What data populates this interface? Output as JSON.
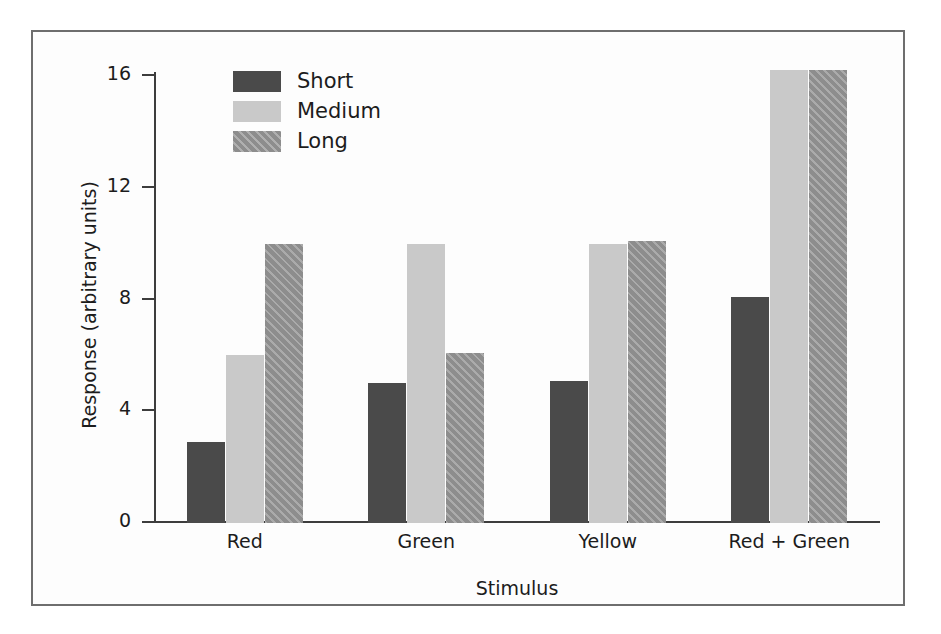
{
  "chart_data": {
    "type": "bar",
    "title": "",
    "subtitle": "",
    "xlabel": "Stimulus",
    "ylabel": "Response (arbitrary units)",
    "categories": [
      "Red",
      "Green",
      "Yellow",
      "Red + Green"
    ],
    "series": [
      {
        "name": "Short",
        "values": [
          2.9,
          5.0,
          5.1,
          8.1
        ],
        "color": "#4a4a4a",
        "pattern": "solid"
      },
      {
        "name": "Medium",
        "values": [
          6.0,
          10.0,
          10.0,
          16.2
        ],
        "color": "#c9c9c9",
        "pattern": "solid"
      },
      {
        "name": "Long",
        "values": [
          10.0,
          6.1,
          10.1,
          16.2
        ],
        "color": "#8d8d8d",
        "pattern": "diagonal-hatch"
      }
    ],
    "ylim": [
      0,
      16.8
    ],
    "yticks": [
      0,
      4,
      8,
      12,
      16
    ],
    "ytick_labels": [
      "0",
      "4",
      "8",
      "12",
      "16"
    ],
    "grid": false,
    "legend_position": "top-left-inside"
  },
  "legend": {
    "entries": [
      {
        "label": "Short"
      },
      {
        "label": "Medium"
      },
      {
        "label": "Long"
      }
    ]
  },
  "axes": {
    "y_label": "Response (arbitrary units)",
    "x_label": "Stimulus"
  }
}
